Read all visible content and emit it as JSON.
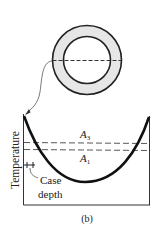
{
  "figure": {
    "ring": {
      "fill": "#e6e6e6",
      "stroke": "#222"
    },
    "labels": {
      "a3": "A",
      "a3_sub": "3",
      "a1": "A",
      "a1_sub": "1",
      "ylabel": "Temperature",
      "case_depth_line1": "Case",
      "case_depth_line2": "depth",
      "caption": "(b)"
    }
  }
}
